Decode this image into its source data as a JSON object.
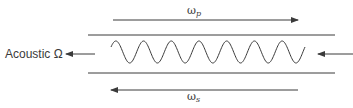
{
  "diagram": {
    "type": "stimulated-brillouin-scattering",
    "colors": {
      "stroke": "#3a3a3a",
      "background": "#ffffff"
    },
    "labels": {
      "pump": {
        "symbol": "ω",
        "subscript": "p"
      },
      "stokes": {
        "symbol": "ω",
        "subscript": "s"
      },
      "acoustic": "Acoustic Ω"
    },
    "wave": {
      "cycles": 7,
      "x_start": 111,
      "x_end": 305,
      "center_y": 52,
      "amplitude": 11
    },
    "arrows": [
      {
        "id": "pump-arrow",
        "direction": "right"
      },
      {
        "id": "stokes-arrow",
        "direction": "left"
      },
      {
        "id": "acoustic-arrow",
        "direction": "left"
      },
      {
        "id": "input-arrow",
        "direction": "left"
      }
    ]
  }
}
